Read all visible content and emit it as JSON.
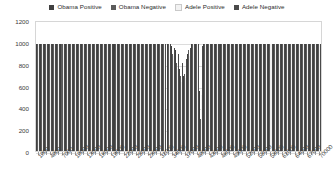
{
  "chart_data": {
    "type": "bar",
    "title": "",
    "xlabel": "",
    "ylabel": "",
    "ylim": [
      0,
      1200
    ],
    "yticks": [
      0,
      200,
      400,
      600,
      800,
      1000,
      1200
    ],
    "grid": true,
    "legend_position": "top-center",
    "categories": [
      "1000",
      "2000",
      "3000",
      "4000",
      "5000",
      "6000",
      "7000",
      "8000",
      "9000",
      "10000",
      "11000",
      "12000",
      "13000",
      "14000",
      "15000",
      "16000",
      "17000",
      "18000",
      "19000",
      "20000",
      "21000",
      "22000",
      "23000",
      "24000",
      "25000",
      "26000",
      "27000",
      "28000",
      "29000",
      "30000",
      "31000",
      "32000",
      "33000",
      "34000",
      "35000",
      "36000",
      "37000",
      "38000",
      "39000",
      "40000",
      "41000",
      "42000",
      "43000",
      "44000",
      "45000",
      "46000",
      "47000",
      "48000",
      "49000",
      "50000",
      "51000",
      "52000",
      "53000",
      "54000",
      "55000",
      "56000",
      "57000",
      "58000",
      "59000",
      "60000",
      "61000",
      "62000",
      "63000",
      "64000",
      "65000",
      "66000",
      "67000",
      "68000",
      "69000",
      "70000"
    ],
    "xtick_labels": [
      "1000",
      "4000",
      "7000",
      "10000",
      "13000",
      "16000",
      "19000",
      "22000",
      "25000",
      "28000",
      "31000",
      "34000",
      "37000",
      "40000",
      "43000",
      "46000",
      "49000",
      "52000",
      "55000",
      "58000",
      "61000",
      "64000",
      "67000",
      "70000"
    ],
    "xtick_every": 3,
    "series": [
      {
        "name": "Obama Positive",
        "color": "#404040",
        "values": [
          1000,
          1000,
          1000,
          1000,
          1000,
          1000,
          1000,
          1000,
          1000,
          1000,
          1000,
          1000,
          1000,
          1000,
          1000,
          1000,
          1000,
          1000,
          1000,
          1000,
          1000,
          1000,
          1000,
          1000,
          1000,
          1000,
          1000,
          1000,
          1000,
          1000,
          1000,
          1000,
          1000,
          980,
          940,
          760,
          700,
          900,
          1000,
          1000,
          560,
          1000,
          1000,
          1000,
          1000,
          1000,
          1000,
          1000,
          1000,
          1000,
          1000,
          1000,
          1000,
          1000,
          1000,
          1000,
          1000,
          1000,
          1000,
          1000,
          1000,
          1000,
          1000,
          1000,
          1000,
          1000,
          1000,
          1000,
          1000,
          1000
        ]
      },
      {
        "name": "Obama Negative",
        "color": "#5c5c5c",
        "values": [
          1000,
          1000,
          1000,
          1000,
          1000,
          1000,
          1000,
          1000,
          1000,
          1000,
          1000,
          1000,
          1000,
          1000,
          1000,
          1000,
          1000,
          1000,
          1000,
          1000,
          1000,
          1000,
          1000,
          1000,
          1000,
          1000,
          1000,
          1000,
          1000,
          1000,
          1000,
          1000,
          1000,
          900,
          820,
          700,
          720,
          940,
          1000,
          1000,
          300,
          1000,
          1000,
          1000,
          1000,
          1000,
          1000,
          1000,
          1000,
          1000,
          1000,
          1000,
          1000,
          1000,
          1000,
          1000,
          1000,
          1000,
          1000,
          1000,
          1000,
          1000,
          1000,
          1000,
          1000,
          1000,
          1000,
          1000,
          1000,
          1000
        ]
      },
      {
        "name": "Adele Positive",
        "color": "#f2f2f2",
        "values": [
          1000,
          1000,
          1000,
          1000,
          1000,
          1000,
          1000,
          1000,
          1000,
          1000,
          1000,
          1000,
          1000,
          1000,
          1000,
          1000,
          1000,
          1000,
          1000,
          1000,
          1000,
          1000,
          1000,
          1000,
          1000,
          1000,
          1000,
          1000,
          1000,
          1000,
          1000,
          1000,
          1000,
          880,
          760,
          640,
          680,
          880,
          1000,
          1000,
          520,
          1000,
          1000,
          1000,
          1000,
          1000,
          1000,
          1000,
          1000,
          1000,
          1000,
          1000,
          1000,
          1000,
          1000,
          1000,
          1000,
          1000,
          1000,
          1000,
          1000,
          1000,
          1000,
          1000,
          1000,
          1000,
          1000,
          1000,
          1000,
          1000
        ]
      },
      {
        "name": "Adele Negative",
        "color": "#4a4a4a",
        "values": [
          1000,
          1000,
          1000,
          1000,
          1000,
          1000,
          1000,
          1000,
          1000,
          1000,
          1000,
          1000,
          1000,
          1000,
          1000,
          1000,
          1000,
          1000,
          1000,
          1000,
          1000,
          1000,
          1000,
          1000,
          1000,
          1000,
          1000,
          1000,
          1000,
          1000,
          1000,
          1000,
          1000,
          960,
          900,
          820,
          860,
          960,
          1000,
          1000,
          980,
          1000,
          1000,
          1000,
          1000,
          1000,
          1000,
          1000,
          1000,
          1000,
          1000,
          1000,
          1000,
          1000,
          1000,
          1000,
          1000,
          1000,
          1000,
          1000,
          1000,
          1000,
          1000,
          1000,
          1000,
          1000,
          1000,
          1000,
          1000,
          1000
        ]
      }
    ]
  },
  "colors": {
    "grid": "#dcdcdc",
    "frame": "#d6d6d6",
    "text": "#3a3a3a",
    "background": "#ffffff"
  }
}
